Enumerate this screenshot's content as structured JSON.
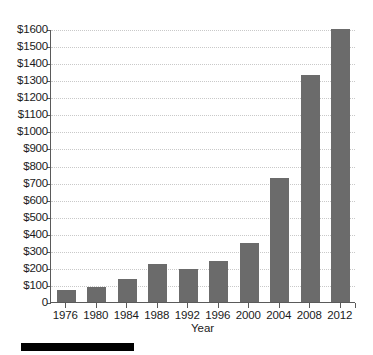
{
  "chart_data": {
    "type": "bar",
    "title": "",
    "subtitle": "",
    "xlabel": "Year",
    "ylabel": "",
    "categories": [
      "1976",
      "1980",
      "1984",
      "1988",
      "1992",
      "1996",
      "2000",
      "2004",
      "2008",
      "2012"
    ],
    "values": [
      70,
      90,
      135,
      220,
      195,
      240,
      345,
      725,
      1330,
      1600
    ],
    "ylim": [
      0,
      1600
    ],
    "ytick_step": 100,
    "ytick_labels": [
      "0",
      "$100",
      "$200",
      "$300",
      "$400",
      "$500",
      "$600",
      "$700",
      "$800",
      "$900",
      "$1000",
      "$1100",
      "$1200",
      "$1300",
      "$1400",
      "$1500",
      "$1600"
    ],
    "ytick_values": [
      0,
      100,
      200,
      300,
      400,
      500,
      600,
      700,
      800,
      900,
      1000,
      1100,
      1200,
      1300,
      1400,
      1500,
      1600
    ],
    "grid": true,
    "grid_axis": "y",
    "grid_style": "dotted",
    "legend": false,
    "legend_position": "none",
    "value_prefix": "$",
    "colors": {
      "bar": "#6b6b6b",
      "axis": "#5a5a5a",
      "gridline": "#c9c9c9",
      "text": "#1b1b1b",
      "background": "#ffffff",
      "redaction": "#000000"
    }
  },
  "annotations": {
    "redaction_bar": ""
  }
}
